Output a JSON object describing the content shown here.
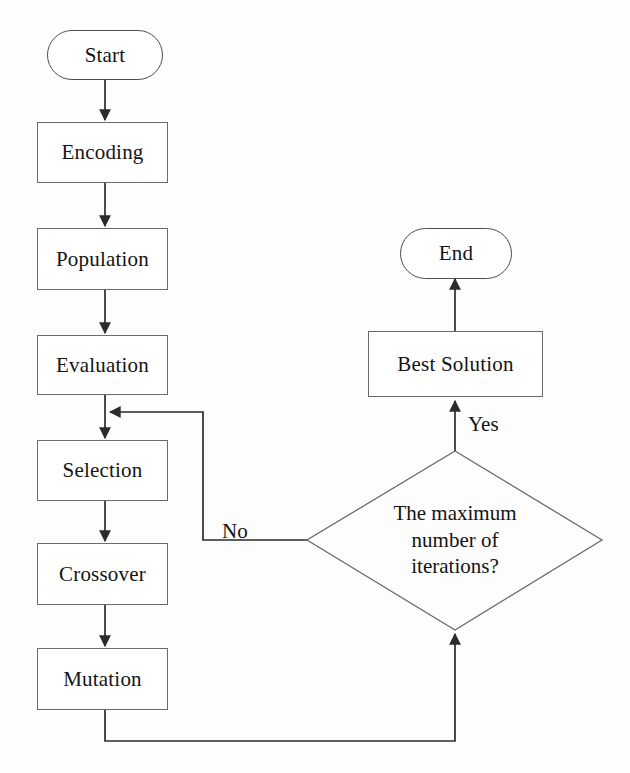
{
  "diagram": {
    "background_color": "#fdfdfd",
    "line_color": "#2b2b2b",
    "text_color": "#141414"
  },
  "nodes": {
    "start": {
      "label": "Start",
      "shape": "terminator"
    },
    "encoding": {
      "label": "Encoding",
      "shape": "process"
    },
    "population": {
      "label": "Population",
      "shape": "process"
    },
    "evaluation": {
      "label": "Evaluation",
      "shape": "process"
    },
    "selection": {
      "label": "Selection",
      "shape": "process"
    },
    "crossover": {
      "label": "Crossover",
      "shape": "process"
    },
    "mutation": {
      "label": "Mutation",
      "shape": "process"
    },
    "decision": {
      "shape": "diamond",
      "line1": "The maximum",
      "line2": "number of",
      "line3": "iterations?"
    },
    "best_solution": {
      "label": "Best Solution",
      "shape": "process"
    },
    "end": {
      "label": "End",
      "shape": "terminator"
    }
  },
  "edge_labels": {
    "no": "No",
    "yes": "Yes"
  }
}
